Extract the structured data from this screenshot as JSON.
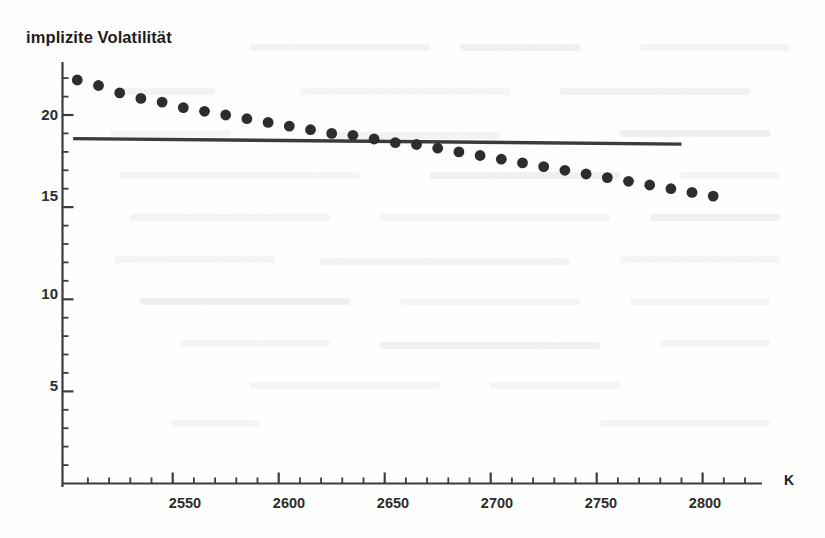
{
  "chart_data": {
    "type": "scatter",
    "title": "implizite Volatilität",
    "xlabel": "K",
    "ylabel": "",
    "xlim": [
      2498,
      2828
    ],
    "ylim": [
      0,
      23.5
    ],
    "grid": false,
    "legend": "none",
    "x_ticks_major": [
      2550,
      2600,
      2650,
      2700,
      2750,
      2800
    ],
    "x_tick_labels": [
      "2550",
      "2600",
      "2650",
      "2700",
      "2750",
      "2800"
    ],
    "x_minor_step": 10,
    "y_ticks_major": [
      5,
      10,
      15,
      20
    ],
    "y_tick_labels": [
      "5",
      "10",
      "15",
      "20"
    ],
    "y_minor_step": 1,
    "series": [
      {
        "name": "implizite Volatilität (Marktdaten)",
        "style": "points",
        "marker": "filled-circle",
        "color": "#2b2b2b",
        "x": [
          2505,
          2515,
          2525,
          2535,
          2545,
          2555,
          2565,
          2575,
          2585,
          2595,
          2605,
          2615,
          2625,
          2635,
          2645,
          2655,
          2665,
          2675,
          2685,
          2695,
          2705,
          2715,
          2725,
          2735,
          2745,
          2755,
          2765,
          2775,
          2785,
          2795,
          2805
        ],
        "y": [
          21.9,
          21.6,
          21.2,
          20.9,
          20.7,
          20.4,
          20.2,
          20.0,
          19.8,
          19.6,
          19.4,
          19.2,
          19.0,
          18.9,
          18.7,
          18.5,
          18.4,
          18.2,
          18.0,
          17.8,
          17.6,
          17.4,
          17.2,
          17.0,
          16.8,
          16.6,
          16.4,
          16.2,
          16.0,
          15.8,
          15.6
        ]
      },
      {
        "name": "konstante Volatilität (Black-Scholes)",
        "style": "line",
        "color": "#3a3a3a",
        "x": [
          2503,
          2790
        ],
        "y": [
          18.72,
          18.42
        ]
      }
    ]
  },
  "figure": {
    "title": "implizite Volatilität",
    "x_axis_symbol": "K"
  }
}
